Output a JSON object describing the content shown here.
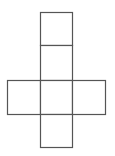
{
  "diagram": {
    "type": "cube-net",
    "stroke_color": "#555555",
    "fill_color": "#ffffff",
    "stroke_width": 1.2,
    "squares": [
      {
        "id": "top",
        "x": 40,
        "y": 12,
        "w": 32,
        "h": 33
      },
      {
        "id": "upper-middle",
        "x": 40,
        "y": 45,
        "w": 32,
        "h": 35
      },
      {
        "id": "left",
        "x": 7,
        "y": 80,
        "w": 33,
        "h": 34
      },
      {
        "id": "center",
        "x": 40,
        "y": 80,
        "w": 32,
        "h": 34
      },
      {
        "id": "right",
        "x": 72,
        "y": 80,
        "w": 33,
        "h": 34
      },
      {
        "id": "bottom",
        "x": 40,
        "y": 114,
        "w": 32,
        "h": 33
      }
    ]
  }
}
